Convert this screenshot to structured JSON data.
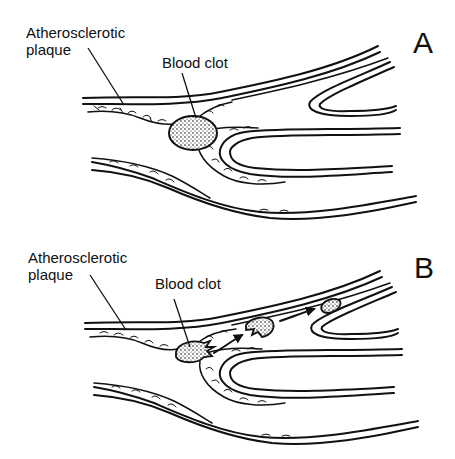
{
  "figure": {
    "colors": {
      "ink": "#111111",
      "background": "#ffffff",
      "clot_fill": "#d9d9d9"
    }
  },
  "panels": [
    {
      "letter": "A",
      "labels": {
        "plaque_line1": "Atherosclerotic",
        "plaque_line2": "plaque",
        "clot": "Blood clot"
      },
      "state": "clot attached at plaque, occluding branch point"
    },
    {
      "letter": "B",
      "labels": {
        "plaque_line1": "Atherosclerotic",
        "plaque_line2": "plaque",
        "clot": "Blood clot"
      },
      "state": "clot fragments break off and travel downstream (arrows)",
      "arrows": 2,
      "fragments": 2
    }
  ]
}
